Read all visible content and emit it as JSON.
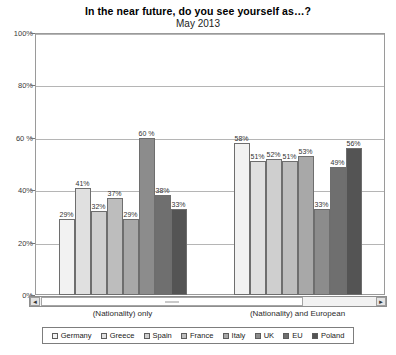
{
  "chart_data": {
    "type": "bar",
    "title": "In the near future, do you see yourself as…?",
    "subtitle": "May 2013",
    "xlabel": "",
    "ylabel": "",
    "ylim": [
      0,
      100
    ],
    "yticks": [
      0,
      20,
      40,
      60,
      80,
      100
    ],
    "ytick_labels": [
      "0%",
      "20%",
      "40%",
      "60 %",
      "80%",
      "100%"
    ],
    "grid": true,
    "legend_position": "bottom",
    "categories": [
      "(Nationality) only",
      "(Nationality) and European"
    ],
    "series": [
      {
        "name": "Germany",
        "color": "#f2f2f2",
        "values": [
          29,
          58
        ],
        "labels": [
          "29%",
          "58%"
        ]
      },
      {
        "name": "Greece",
        "color": "#e0e0e0",
        "values": [
          41,
          51
        ],
        "labels": [
          "41%",
          "51%"
        ]
      },
      {
        "name": "Spain",
        "color": "#cfcfcf",
        "values": [
          32,
          52
        ],
        "labels": [
          "32%",
          "52%"
        ]
      },
      {
        "name": "France",
        "color": "#bdbdbd",
        "values": [
          37,
          51
        ],
        "labels": [
          "37%",
          "51%"
        ]
      },
      {
        "name": "Italy",
        "color": "#a8a8a8",
        "values": [
          29,
          53
        ],
        "labels": [
          "29%",
          "53%"
        ]
      },
      {
        "name": "UK",
        "color": "#8c8c8c",
        "values": [
          60,
          33
        ],
        "labels": [
          "60 %",
          "33%"
        ]
      },
      {
        "name": "EU",
        "color": "#6f6f6f",
        "values": [
          38,
          49
        ],
        "labels": [
          "38%",
          "49%"
        ]
      },
      {
        "name": "Poland",
        "color": "#545454",
        "values": [
          33,
          56
        ],
        "labels": [
          "33%",
          "56%"
        ]
      }
    ]
  },
  "scrollbar": {
    "left_arrow": "◄",
    "right_arrow": "►"
  }
}
